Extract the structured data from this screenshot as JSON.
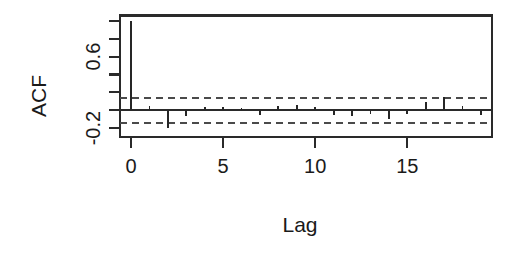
{
  "chart_data": {
    "type": "bar",
    "title": "",
    "subtitle": "",
    "xlabel": "Lag",
    "ylabel": "ACF",
    "xlim": [
      -0.6,
      19.6
    ],
    "ylim": [
      -0.3,
      1.06
    ],
    "grid": false,
    "legend": null,
    "x_ticks": [
      0,
      5,
      10,
      15
    ],
    "x_tick_labels": [
      "0",
      "5",
      "10",
      "15"
    ],
    "y_ticks": [
      1.0,
      0.8,
      0.6,
      0.4,
      0.2,
      0.0,
      -0.2
    ],
    "y_tick_labels": [
      "",
      "",
      "0.6",
      "",
      "",
      "",
      "-0.2"
    ],
    "y_labeled_ticks": [
      {
        "value": 0.6,
        "label": "0.6"
      },
      {
        "value": -0.2,
        "label": "-0.2"
      }
    ],
    "confidence_bands": {
      "upper": 0.14,
      "lower": -0.14,
      "style": "dashed",
      "color": "#4a4a4a"
    },
    "zero_reference": 0.0,
    "series_name": "ACF",
    "x": [
      0,
      1,
      2,
      3,
      4,
      5,
      6,
      7,
      8,
      9,
      10,
      11,
      12,
      13,
      14,
      15,
      16,
      17,
      18,
      19
    ],
    "values": [
      1.0,
      0.05,
      -0.2,
      -0.06,
      0.04,
      0.04,
      0.03,
      -0.05,
      0.05,
      0.06,
      0.04,
      -0.05,
      -0.06,
      -0.04,
      -0.1,
      -0.04,
      0.09,
      0.15,
      0.05,
      -0.05
    ]
  },
  "axes": {
    "y_axis_title": "ACF",
    "x_axis_title": "Lag"
  }
}
